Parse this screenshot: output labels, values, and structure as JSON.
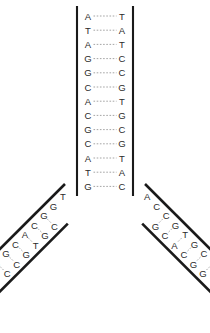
{
  "diagram": {
    "background_color": "#ffffff",
    "backbone_color": "#1a1a1a",
    "letter_color": "#2b2b2b",
    "hbond_color": "#9a9a9a",
    "trunk": {
      "name": "double-stranded-trunk",
      "pair_count": 13,
      "left_strand": [
        "A",
        "T",
        "A",
        "G",
        "G",
        "C",
        "A",
        "C",
        "G",
        "C",
        "A",
        "T",
        "G"
      ],
      "right_strand": [
        "T",
        "A",
        "T",
        "C",
        "C",
        "G",
        "T",
        "G",
        "C",
        "G",
        "T",
        "A",
        "C"
      ],
      "geometry": {
        "left_backbone_x": 77,
        "right_backbone_x": 133,
        "left_letter_x": 88,
        "right_letter_x": 122,
        "first_pair_y": 16,
        "pair_spacing": 14.2
      }
    },
    "left_fork": {
      "name": "left-fork-branch",
      "pair_count": 6,
      "outer_strand": [
        "T",
        "G",
        "G",
        "C",
        "A",
        "C",
        "G",
        "G"
      ],
      "inner_strand": [
        "C",
        "G",
        "T",
        "G",
        "C",
        "C"
      ],
      "unpaired_outer_leading": [
        "T",
        "G"
      ],
      "geometry": {
        "origin_x": 77,
        "origin_y": 196,
        "angle_deg": 45
      }
    },
    "right_fork": {
      "name": "right-fork-branch",
      "pair_count": 6,
      "outer_strand": [
        "A",
        "C",
        "C",
        "G",
        "T",
        "G",
        "C",
        "C"
      ],
      "inner_strand": [
        "G",
        "C",
        "A",
        "C",
        "G",
        "G"
      ],
      "unpaired_outer_leading": [
        "A",
        "C"
      ],
      "geometry": {
        "origin_x": 133,
        "origin_y": 196,
        "angle_deg": 45
      }
    }
  }
}
